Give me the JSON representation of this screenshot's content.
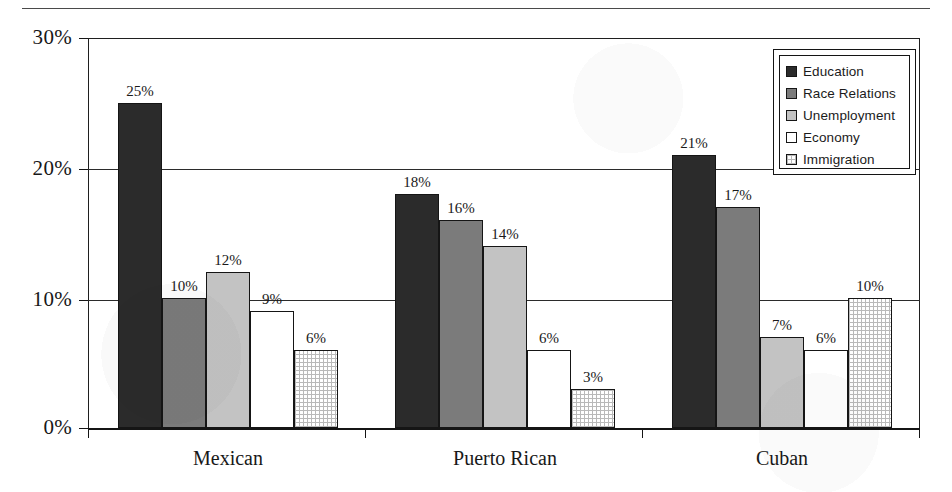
{
  "chart_data": {
    "type": "bar",
    "title": "",
    "subtitle": "",
    "xlabel": "",
    "ylabel": "",
    "categories": [
      "Mexican",
      "Puerto Rican",
      "Cuban"
    ],
    "series": [
      {
        "name": "Education",
        "values": [
          25,
          18,
          21
        ],
        "labels": [
          "25%",
          "18%",
          "21%"
        ],
        "color": "#2b2b2b",
        "fill_style": "solid-dark"
      },
      {
        "name": "Race Relations",
        "values": [
          10,
          16,
          17
        ],
        "labels": [
          "10%",
          "16%",
          "17%"
        ],
        "color": "#7b7b7b",
        "fill_style": "solid-medium-gray"
      },
      {
        "name": "Unemployment",
        "values": [
          12,
          14,
          7
        ],
        "labels": [
          "12%",
          "14%",
          "7%"
        ],
        "color": "#c3c3c3",
        "fill_style": "solid-light-gray"
      },
      {
        "name": "Economy",
        "values": [
          9,
          6,
          6
        ],
        "labels": [
          "9%",
          "6%",
          "6%"
        ],
        "color": "#ffffff",
        "fill_style": "white"
      },
      {
        "name": "Immigration",
        "values": [
          6,
          3,
          10
        ],
        "labels": [
          "6%",
          "3%",
          "10%"
        ],
        "color": "#ffffff",
        "fill_style": "crosshatch-grid"
      }
    ],
    "ylim": [
      0,
      30
    ],
    "ytick_values": [
      0,
      10,
      20,
      30
    ],
    "ytick_labels": [
      "0%",
      "10%",
      "20%",
      "30%"
    ],
    "grid": true,
    "grid_axis": "y",
    "legend_position": "top-right",
    "value_labels_shown": true
  },
  "axes": {
    "y_ticks": [
      {
        "label": "30%",
        "value": 30
      },
      {
        "label": "20%",
        "value": 20
      },
      {
        "label": "10%",
        "value": 10
      },
      {
        "label": "0%",
        "value": 0
      }
    ],
    "x_categories": [
      {
        "label": "Mexican"
      },
      {
        "label": "Puerto Rican"
      },
      {
        "label": "Cuban"
      }
    ]
  },
  "legend": {
    "items": [
      {
        "label": "Education",
        "swatch": "legend-swatch-education"
      },
      {
        "label": "Race Relations",
        "swatch": "legend-swatch-race-relations"
      },
      {
        "label": "Unemployment",
        "swatch": "legend-swatch-unemployment"
      },
      {
        "label": "Economy",
        "swatch": "legend-swatch-economy"
      },
      {
        "label": "Immigration",
        "swatch": "legend-swatch-immigration"
      }
    ]
  },
  "colors": {
    "education": "#2b2b2b",
    "race_relations": "#7b7b7b",
    "unemployment": "#c3c3c3",
    "economy": "#ffffff",
    "immigration": "#ffffff",
    "axis": "#151515",
    "text": "#1a1a1a"
  }
}
